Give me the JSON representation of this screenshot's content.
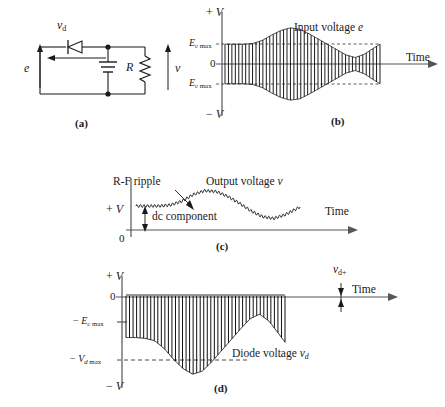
{
  "figure": {
    "ink_color": "#1a1a1a",
    "panels": [
      {
        "tag": "(a)",
        "type": "circuit-schematic",
        "labels": {
          "diode_voltage": "v",
          "diode_voltage_sub": "d",
          "source": "e",
          "resistor": "R",
          "output": "v"
        }
      },
      {
        "tag": "(b)",
        "type": "waveform",
        "caption": "Input voltage e",
        "axis": {
          "y_top": "+ V",
          "y_bottom": "− V",
          "zero": "0",
          "x_label": "Time",
          "tick_upper": "E",
          "tick_upper_sub": "c max",
          "tick_lower": "E",
          "tick_lower_sub": "c max"
        }
      },
      {
        "tag": "(c)",
        "type": "waveform",
        "caption": "Output voltage v",
        "annotations": {
          "ripple": "R-F ripple",
          "dc": "dc component"
        },
        "axis": {
          "y_top": "+ V",
          "zero": "0",
          "x_label": "Time"
        }
      },
      {
        "tag": "(d)",
        "type": "waveform",
        "caption": "Diode voltage v",
        "caption_sub": "d",
        "annotations": {
          "forward": "v",
          "forward_sub": "d+"
        },
        "axis": {
          "y_top": "+ V",
          "y_bottom": "− V",
          "zero": "0",
          "x_label": "Time",
          "tick_ec": "− E",
          "tick_ec_sub": "c max",
          "tick_vd": "− V",
          "tick_vd_sub": "d max"
        }
      }
    ]
  },
  "chart_data": {
    "type": "line",
    "charts": [
      {
        "id": "b",
        "name": "Input voltage e",
        "description": "Amplitude-modulated RF carrier, symmetric about zero",
        "xlabel": "Time",
        "ylabel": "V",
        "ylim": [
          -1,
          1
        ],
        "carrier_cycles": 46,
        "envelope_x": [
          0,
          0.06,
          0.12,
          0.18,
          0.24,
          0.3,
          0.36,
          0.42,
          0.48,
          0.54,
          0.6,
          0.66,
          0.72,
          0.78,
          0.84,
          0.9,
          0.96,
          1.0
        ],
        "envelope_y": [
          0.52,
          0.52,
          0.52,
          0.54,
          0.62,
          0.76,
          0.88,
          0.95,
          0.92,
          0.8,
          0.66,
          0.52,
          0.38,
          0.24,
          0.17,
          0.26,
          0.42,
          0.52
        ],
        "markers": {
          "Ec_max": 0.52,
          "minus_Ec_max": -0.52
        }
      },
      {
        "id": "c",
        "name": "Output voltage v",
        "description": "Rectified and filtered envelope with small R-F ripple riding on a dc component",
        "xlabel": "Time",
        "ylabel": "V",
        "ylim": [
          0,
          1
        ],
        "ripple_amplitude": 0.03,
        "envelope_x": [
          0,
          0.07,
          0.14,
          0.21,
          0.28,
          0.35,
          0.42,
          0.49,
          0.56,
          0.63,
          0.7,
          0.77,
          0.84,
          0.91,
          1.0
        ],
        "envelope_y": [
          0.5,
          0.5,
          0.5,
          0.52,
          0.6,
          0.74,
          0.82,
          0.8,
          0.7,
          0.56,
          0.4,
          0.28,
          0.24,
          0.32,
          0.48
        ],
        "markers": {
          "dc_component": 0.5
        }
      },
      {
        "id": "d",
        "name": "Diode voltage vd",
        "description": "Almost entirely negative; peaks just reach zero, troughs follow inverted modulation envelope",
        "xlabel": "Time",
        "ylabel": "V",
        "ylim": [
          -1,
          0.12
        ],
        "carrier_cycles": 46,
        "envelope_x": [
          0,
          0.06,
          0.12,
          0.18,
          0.24,
          0.3,
          0.36,
          0.42,
          0.48,
          0.54,
          0.6,
          0.66,
          0.72,
          0.78,
          0.84,
          0.9,
          0.96,
          1.0
        ],
        "envelope_y": [
          -0.52,
          -0.52,
          -0.53,
          -0.56,
          -0.66,
          -0.8,
          -0.92,
          -0.99,
          -0.95,
          -0.83,
          -0.69,
          -0.55,
          -0.41,
          -0.28,
          -0.22,
          -0.31,
          -0.47,
          -0.58
        ],
        "markers": {
          "minus_Ec_max": -0.4,
          "minus_Vd_max": -0.78,
          "vd_plus": 0.06
        }
      }
    ]
  }
}
